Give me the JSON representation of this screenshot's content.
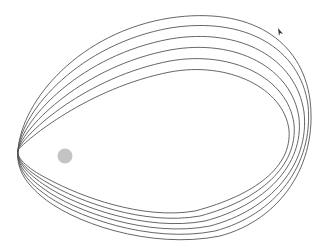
{
  "diagram": {
    "type": "precessing-orbits",
    "orbit_count": 6,
    "colors": {
      "orbit_stroke": "#555555",
      "central_body": "#c4c4c4",
      "arrow": "#333333",
      "background": "#ffffff"
    },
    "central_body": {
      "cx": 65,
      "cy": 156,
      "r": 7.5
    },
    "arrow": {
      "x": 280,
      "y": 32,
      "direction": "up-left"
    },
    "orbits": [
      {
        "d": "M18,150 C22,100 80,32 170,18 C250,6 302,40 310,100 C318,165 280,220 220,236 C150,250 70,222 40,195 C25,182 16,168 18,150 Z"
      },
      {
        "d": "M18,150 C22,110 80,44 170,28 C245,16 300,48 308,105 C314,165 275,215 215,231 C150,244 72,216 42,192 C26,180 16,166 18,150 Z"
      },
      {
        "d": "M18,150 C23,118 82,55 170,39 C240,27 296,58 304,112 C310,165 270,210 210,226 C148,238 74,211 44,189 C27,177 16,164 18,150 Z"
      },
      {
        "d": "M18,150 C24,126 84,66 170,50 C236,38 292,68 299,118 C304,165 265,205 205,221 C146,232 76,206 46,186 C28,174 16,162 18,150 Z"
      },
      {
        "d": "M18,150 C25,133 86,77 170,61 C232,50 288,78 294,124 C298,166 260,200 200,216 C144,226 78,201 48,183 C29,172 16,161 18,150 Z"
      },
      {
        "d": "M18,150 C26,140 88,88 170,72 C228,61 284,88 289,130 C292,167 255,195 195,211 C142,220 80,196 50,180 C30,170 16,159 18,150 Z"
      }
    ]
  }
}
